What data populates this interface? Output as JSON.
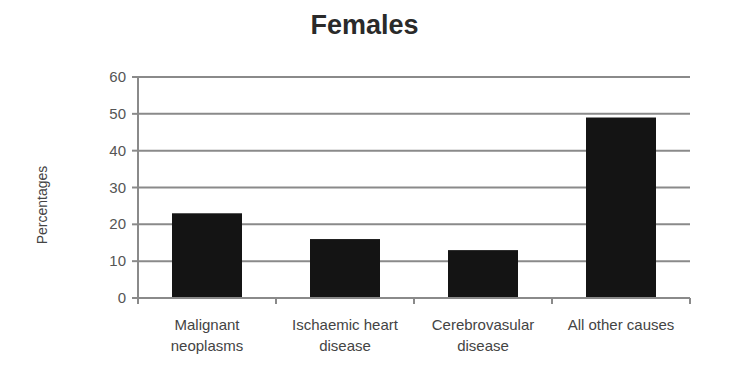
{
  "chart_data": {
    "type": "bar",
    "title": "Females",
    "xlabel": "",
    "ylabel": "Percentages",
    "categories": [
      "Malignant neoplasms",
      "Ischaemic heart disease",
      "Cerebrovasular disease",
      "All other causes"
    ],
    "category_lines": [
      [
        "Malignant",
        "neoplasms"
      ],
      [
        "Ischaemic heart",
        "disease"
      ],
      [
        "Cerebrovasular",
        "disease"
      ],
      [
        "All other causes",
        ""
      ]
    ],
    "values": [
      23,
      16,
      13,
      49
    ],
    "ylim": [
      0,
      60
    ],
    "yticks": [
      0,
      10,
      20,
      30,
      40,
      50,
      60
    ],
    "grid": true,
    "legend": "none",
    "bar_color": "#141414"
  }
}
